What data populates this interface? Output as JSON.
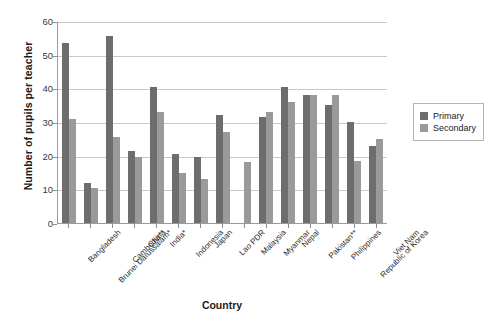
{
  "chart_data": {
    "type": "bar",
    "title": "",
    "xlabel": "Country",
    "ylabel": "Number of pupils per teacher",
    "ylim": [
      0,
      60
    ],
    "yticks": [
      0,
      10,
      20,
      30,
      40,
      50,
      60
    ],
    "grid": true,
    "legend_position": "right",
    "categories": [
      "Bangladesh",
      "Brunei Darussalam*",
      "Cambodia**",
      "China",
      "India*",
      "Indonesia",
      "Japan",
      "Lao PDR",
      "Malaysia",
      "Myanmar",
      "Nepal",
      "Pakistan**",
      "Philippines",
      "Republic of Korea",
      "Viet Nam"
    ],
    "series": [
      {
        "name": "Primary",
        "color": "#6d6d6d",
        "values": [
          53.5,
          12.0,
          55.5,
          21.5,
          40.5,
          20.5,
          19.5,
          32.0,
          0.0,
          31.5,
          40.5,
          38.0,
          35.0,
          30.0,
          23.0
        ]
      },
      {
        "name": "Secondary",
        "color": "#9a9a9a",
        "values": [
          31.0,
          10.5,
          25.5,
          19.5,
          33.0,
          15.0,
          13.0,
          27.0,
          18.0,
          33.0,
          36.0,
          38.0,
          38.0,
          18.5,
          25.0
        ]
      }
    ]
  },
  "legend": {
    "items": [
      {
        "label": "Primary",
        "swatch": "primary"
      },
      {
        "label": "Secondary",
        "swatch": "secondary"
      }
    ]
  },
  "colors": {
    "primary": "#6d6d6d",
    "secondary": "#9a9a9a",
    "gridline": "#c8c8c8",
    "axis": "#9a9a9a",
    "text": "#1b1b1b"
  }
}
